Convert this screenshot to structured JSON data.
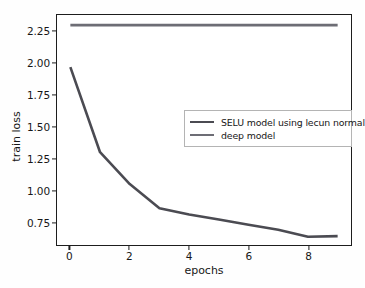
{
  "chart_data": {
    "type": "line",
    "title": "",
    "xlabel": "epochs",
    "ylabel": "train loss",
    "xlim": [
      -0.45,
      9.45
    ],
    "ylim": [
      0.57,
      2.38
    ],
    "grid": false,
    "legend_position": "upper right",
    "x": [
      0,
      1,
      2,
      3,
      4,
      5,
      6,
      7,
      8,
      9
    ],
    "xticks": [
      "0",
      "2",
      "4",
      "6",
      "8"
    ],
    "xtick_values": [
      0,
      2,
      4,
      6,
      8
    ],
    "yticks": [
      "0.75",
      "1.00",
      "1.25",
      "1.50",
      "1.75",
      "2.00",
      "2.25"
    ],
    "ytick_values": [
      0.75,
      1.0,
      1.25,
      1.5,
      1.75,
      2.0,
      2.25
    ],
    "series": [
      {
        "name": "SELU model using lecun normal",
        "color": "#4b4b52",
        "values": [
          1.97,
          1.3,
          1.05,
          0.86,
          0.81,
          0.77,
          0.73,
          0.69,
          0.635,
          0.64
        ]
      },
      {
        "name": "deep model",
        "color": "#6d6d75",
        "values": [
          2.3,
          2.3,
          2.3,
          2.3,
          2.3,
          2.3,
          2.3,
          2.3,
          2.3,
          2.3
        ]
      }
    ]
  },
  "legend": {
    "entries": [
      {
        "label": "SELU model using lecun normal",
        "color": "#4b4b52"
      },
      {
        "label": "deep model",
        "color": "#6d6d75"
      }
    ]
  },
  "axes": {
    "frame_color": "#1d1d1d",
    "background": "#ffffff"
  }
}
